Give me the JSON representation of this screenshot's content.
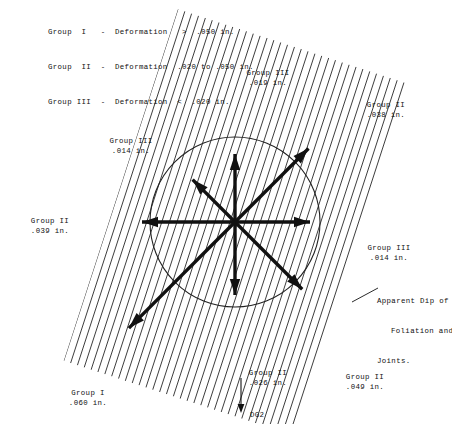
{
  "legend": {
    "rows": [
      "Group  I   -  Deformation   >  .050 in.",
      "Group  II  -  Deformation  .020 to .050 in.",
      "Group III  -  Deformation  <  .020 in."
    ]
  },
  "annotations": {
    "apparent_dip": {
      "line1": "Apparent Dip of",
      "line2": "Foliation and",
      "line3": "Joints."
    },
    "station_label": "DG2"
  },
  "colors": {
    "ink": "#111111",
    "hatch": "#1a1a1a",
    "circle": "#222222",
    "background": "#ffffff"
  },
  "chart_data": {
    "type": "scatter",
    "title": "",
    "subtitle": "",
    "xlabel": "",
    "ylabel": "",
    "center": {
      "x": 235,
      "y": 222
    },
    "circle_radius": 85,
    "hatch_angle_deg": 72,
    "legend_position": "top-left",
    "grid": false,
    "categories": [
      "Group III .019 in.",
      "Group II .038 in.",
      "Group III .014 in.",
      "Group II .039 in.",
      "Group III .014 in.",
      "Group II .026 in.",
      "Group II .049 in.",
      "Group I .060 in."
    ],
    "values": [
      0.019,
      0.038,
      0.014,
      0.039,
      0.014,
      0.026,
      0.049,
      0.06
    ],
    "ylim": [
      0,
      0.06
    ],
    "series": [
      {
        "name": "Deformation vectors",
        "points": [
          {
            "label_line1": "Group III",
            "label_line2": ".019 in.",
            "group": "III",
            "value": 0.019,
            "direction_deg": 90,
            "length_px": 68,
            "label_x": 268,
            "label_y": 68
          },
          {
            "label_line1": "Group II",
            "label_line2": ".038 in.",
            "group": "II",
            "value": 0.038,
            "direction_deg": 45,
            "length_px": 104,
            "label_x": 386,
            "label_y": 100
          },
          {
            "label_line1": "Group III",
            "label_line2": ".014 in.",
            "group": "III",
            "value": 0.014,
            "direction_deg": 135,
            "length_px": 60,
            "label_x": 131,
            "label_y": 136
          },
          {
            "label_line1": "Group II",
            "label_line2": ".039 in.",
            "group": "II",
            "value": 0.039,
            "direction_deg": 180,
            "length_px": 93,
            "label_x": 50,
            "label_y": 216
          },
          {
            "label_line1": "Group III",
            "label_line2": ".014 in.",
            "group": "III",
            "value": 0.014,
            "direction_deg": 0,
            "length_px": 75,
            "label_x": 389,
            "label_y": 243
          },
          {
            "label_line1": "Group II",
            "label_line2": ".026 in.",
            "group": "II",
            "value": 0.026,
            "direction_deg": 270,
            "length_px": 73,
            "label_x": 268,
            "label_y": 368
          },
          {
            "label_line1": "Group II",
            "label_line2": ".049 in.",
            "group": "II",
            "value": 0.049,
            "direction_deg": 315,
            "length_px": 95,
            "label_x": 365,
            "label_y": 372
          },
          {
            "label_line1": "Group I",
            "label_line2": ".060 in.",
            "group": "I",
            "value": 0.06,
            "direction_deg": 225,
            "length_px": 150,
            "label_x": 88,
            "label_y": 388
          }
        ]
      }
    ]
  }
}
